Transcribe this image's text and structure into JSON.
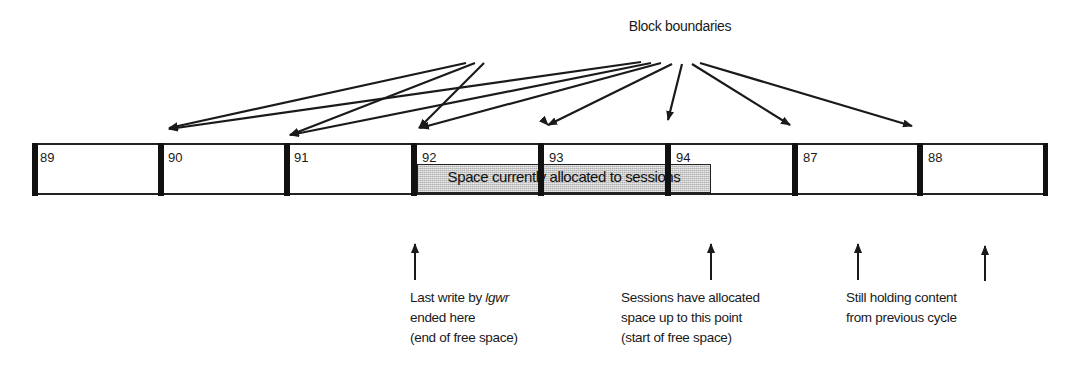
{
  "title": "Block boundaries",
  "blocks": [
    {
      "label": "89",
      "x": 40
    },
    {
      "label": "90",
      "x": 168
    },
    {
      "label": "91",
      "x": 294
    },
    {
      "label": "92",
      "x": 422
    },
    {
      "label": "93",
      "x": 549
    },
    {
      "label": "94",
      "x": 676
    },
    {
      "label": "87",
      "x": 803
    },
    {
      "label": "88",
      "x": 928
    }
  ],
  "allocated_region": {
    "label": "Space currently allocated to sessions"
  },
  "annotations": [
    {
      "lines": [
        "Last write by ",
        "lgwr",
        "ended here",
        "(end of free space)"
      ]
    },
    {
      "lines": [
        "Sessions have allocated",
        "space up to this point",
        "(start of free space)"
      ]
    },
    {
      "lines": [
        "Still holding content",
        "from previous cycle"
      ]
    }
  ],
  "colors": {
    "line": "#1a1a1a",
    "shade": "#c8c8c8",
    "background": "#ffffff"
  }
}
